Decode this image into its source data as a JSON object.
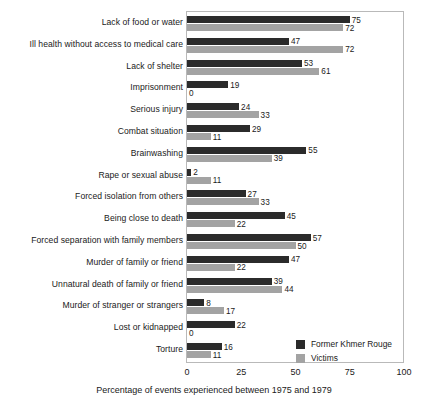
{
  "chart_data": {
    "type": "bar",
    "orientation": "horizontal",
    "title": "",
    "xlabel": "Percentage of events experienced between 1975 and 1979",
    "ylabel": "",
    "xlim": [
      0,
      100
    ],
    "xticks": [
      0,
      25,
      50,
      75,
      100
    ],
    "grid": false,
    "legend_position": "inside-bottom-right",
    "categories": [
      "Lack of food or water",
      "Ill health without access to medical care",
      "Lack of shelter",
      "Imprisonment",
      "Serious injury",
      "Combat situation",
      "Brainwashing",
      "Rape or sexual abuse",
      "Forced isolation from others",
      "Being close to death",
      "Forced separation with family members",
      "Murder of family or friend",
      "Unnatural death of family or friend",
      "Murder of stranger or strangers",
      "Lost or kidnapped",
      "Torture"
    ],
    "series": [
      {
        "name": "Former Khmer Rouge",
        "color": "#2b2b2b",
        "values": [
          75,
          47,
          53,
          19,
          24,
          29,
          55,
          2,
          27,
          45,
          57,
          47,
          39,
          8,
          22,
          16
        ]
      },
      {
        "name": "Victims",
        "color": "#a3a3a3",
        "values": [
          72,
          72,
          61,
          0,
          33,
          11,
          39,
          11,
          33,
          22,
          50,
          22,
          44,
          17,
          0,
          11
        ]
      }
    ]
  },
  "axis": {
    "tick_labels": [
      "0",
      "25",
      "50",
      "75",
      "100"
    ],
    "title": "Percentage of events experienced between 1975 and 1979"
  },
  "legend": {
    "entries": [
      {
        "label": "Former Khmer Rouge",
        "color": "#2b2b2b"
      },
      {
        "label": "Victims",
        "color": "#a3a3a3"
      }
    ]
  },
  "caption": {
    "text": ""
  }
}
